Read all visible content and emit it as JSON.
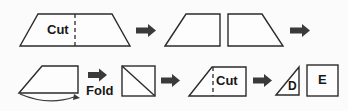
{
  "figure": {
    "background_color": "#fbfbfb",
    "stroke_color": "#2b2b2b",
    "arrow_color": "#3a3a3a"
  },
  "labels": {
    "cut_top": "Cut",
    "fold": "Fold",
    "cut_bottom": "Cut",
    "piece_d": "D",
    "piece_e": "E"
  },
  "rows": [
    {
      "name": "row-1-cut-trapezoid",
      "steps": [
        {
          "name": "trapezoid-with-cut-line",
          "shape": "trapezoid",
          "label": "Cut"
        },
        {
          "name": "arrow-1",
          "shape": "arrow-right"
        },
        {
          "name": "left-half-piece",
          "shape": "right-trapezoid-slant-left"
        },
        {
          "name": "right-half-piece",
          "shape": "right-trapezoid-slant-right"
        },
        {
          "name": "arrow-2",
          "shape": "arrow-right"
        }
      ]
    },
    {
      "name": "row-2-fold-and-cut",
      "steps": [
        {
          "name": "parallelogram-piece",
          "shape": "right-trapezoid-slant-left"
        },
        {
          "name": "fold-arc",
          "shape": "curved-arrow"
        },
        {
          "name": "arrow-3",
          "shape": "arrow-right",
          "label": "Fold"
        },
        {
          "name": "square-with-diagonal",
          "shape": "square-diagonal"
        },
        {
          "name": "arrow-4",
          "shape": "arrow-right"
        },
        {
          "name": "trapezoid-with-cut-line-2",
          "shape": "right-trapezoid-slant-left",
          "label": "Cut"
        },
        {
          "name": "arrow-5",
          "shape": "arrow-right"
        },
        {
          "name": "triangle-d",
          "shape": "right-triangle",
          "label": "D"
        },
        {
          "name": "square-e",
          "shape": "square",
          "label": "E"
        }
      ]
    }
  ]
}
